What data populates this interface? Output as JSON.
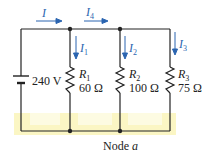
{
  "diagram": {
    "source": {
      "label": "240 V"
    },
    "resistors": [
      {
        "name": "R",
        "sub": "1",
        "value": "60 Ω"
      },
      {
        "name": "R",
        "sub": "2",
        "value": "100 Ω"
      },
      {
        "name": "R",
        "sub": "3",
        "value": "75 Ω"
      }
    ],
    "currents": [
      {
        "name": "I",
        "sub": ""
      },
      {
        "name": "I",
        "sub": "4"
      },
      {
        "name": "I",
        "sub": "1"
      },
      {
        "name": "I",
        "sub": "2"
      },
      {
        "name": "I",
        "sub": "3"
      }
    ],
    "node_label": {
      "prefix": "Node ",
      "name": "a"
    },
    "colors": {
      "wire": "#222222",
      "arrow": "#2a64b0",
      "highlight": "#fbf6c4"
    }
  }
}
